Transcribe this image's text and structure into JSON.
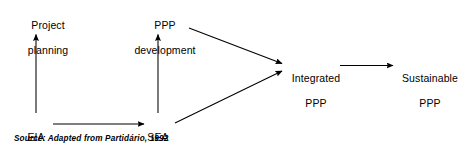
{
  "figure": {
    "type": "flow-diagram",
    "caption": "Source: Adapted from Partidário, 1992",
    "line_color": "#000000",
    "text_color": "#000000",
    "background_color": "#ffffff"
  },
  "nodes": [
    {
      "id": "project-planning",
      "lines": [
        "Project",
        "planning"
      ],
      "line1": "Project",
      "line2": "planning",
      "x": 48,
      "y": 6
    },
    {
      "id": "ppp-development",
      "lines": [
        "PPP",
        "development"
      ],
      "line1": "PPP",
      "line2": "development",
      "x": 165,
      "y": 6
    },
    {
      "id": "integrated-ppp",
      "lines": [
        "Integrated",
        "PPP"
      ],
      "line1": "Integrated",
      "line2": "PPP",
      "x": 316,
      "y": 59
    },
    {
      "id": "sustainable-ppp",
      "lines": [
        "Sustainable",
        "PPP"
      ],
      "line1": "Sustainable",
      "line2": "PPP",
      "x": 430,
      "y": 59
    },
    {
      "id": "eia",
      "lines": [
        "EIA"
      ],
      "line1": "EIA",
      "line2": "",
      "x": 36,
      "y": 118
    },
    {
      "id": "sea",
      "lines": [
        "SEA"
      ],
      "line1": "SEA",
      "line2": "",
      "x": 158,
      "y": 118
    }
  ],
  "edges": [
    {
      "id": "eia-to-project-planning",
      "from": "eia",
      "to": "project-planning",
      "direction": "up"
    },
    {
      "id": "sea-to-ppp-development",
      "from": "sea",
      "to": "ppp-development",
      "direction": "up"
    },
    {
      "id": "eia-to-sea",
      "from": "eia",
      "to": "sea",
      "direction": "right"
    },
    {
      "id": "ppp-development-to-integrated-ppp",
      "from": "ppp-development",
      "to": "integrated-ppp",
      "direction": "down-right"
    },
    {
      "id": "sea-to-integrated-ppp",
      "from": "sea",
      "to": "integrated-ppp",
      "direction": "up-right"
    },
    {
      "id": "integrated-ppp-to-sustainable-ppp",
      "from": "integrated-ppp",
      "to": "sustainable-ppp",
      "direction": "right"
    }
  ]
}
